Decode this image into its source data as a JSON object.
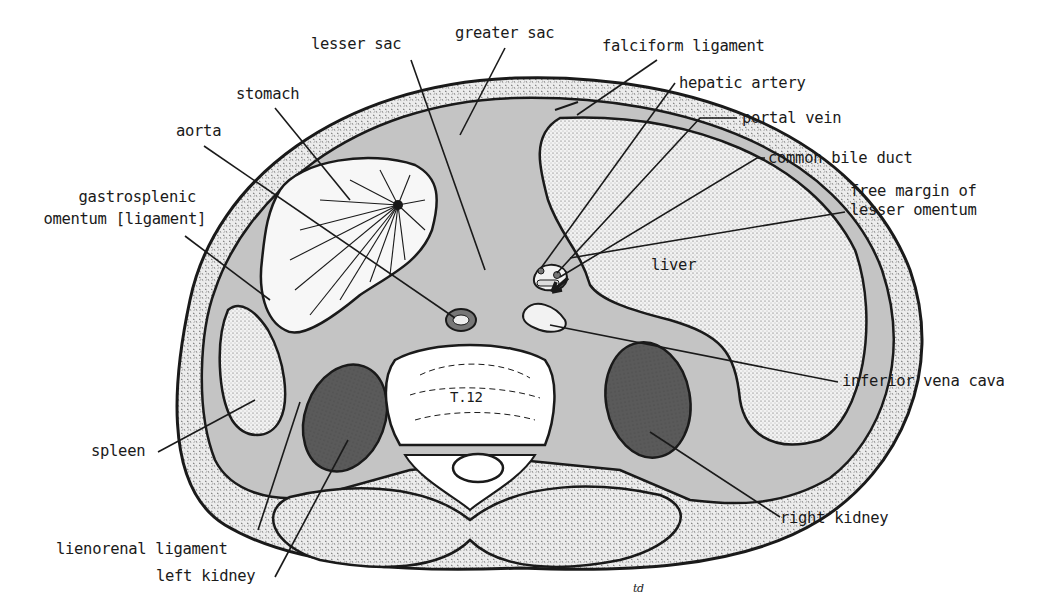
{
  "diagram": {
    "colors": {
      "outline": "#1a1a1a",
      "peritoneal_cavity": "#c4c4c4",
      "kidney": "#555555",
      "muscle_stipple": "#e6e6e6",
      "organ_fill": "#eeeeee",
      "background": "#ffffff"
    },
    "structure_labels": {
      "vertebra": "T.12",
      "liver": "liver",
      "signature": "td"
    },
    "labels": [
      {
        "id": "lesser-sac",
        "text": "lesser sac"
      },
      {
        "id": "greater-sac",
        "text": "greater sac"
      },
      {
        "id": "falciform-ligament",
        "text": "falciform ligament"
      },
      {
        "id": "hepatic-artery",
        "text": "hepatic artery"
      },
      {
        "id": "portal-vein",
        "text": "portal vein"
      },
      {
        "id": "common-bile-duct",
        "text": "common bile duct"
      },
      {
        "id": "free-margin-1",
        "text": "free margin of"
      },
      {
        "id": "free-margin-2",
        "text": "lesser omentum"
      },
      {
        "id": "stomach",
        "text": "stomach"
      },
      {
        "id": "aorta",
        "text": "aorta"
      },
      {
        "id": "gastrosplenic-1",
        "text": "gastrosplenic"
      },
      {
        "id": "gastrosplenic-2",
        "text": "omentum [ligament]"
      },
      {
        "id": "inferior-vena-cava",
        "text": "inferior vena cava"
      },
      {
        "id": "spleen",
        "text": "spleen"
      },
      {
        "id": "right-kidney",
        "text": "right kidney"
      },
      {
        "id": "lienorenal-ligament",
        "text": "lienorenal ligament"
      },
      {
        "id": "left-kidney",
        "text": "left kidney"
      }
    ]
  }
}
